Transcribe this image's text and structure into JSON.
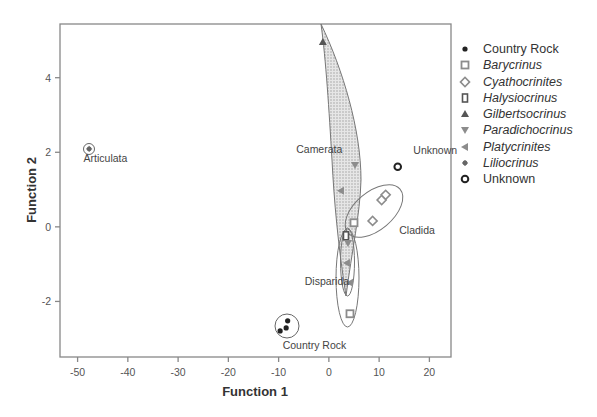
{
  "chart_data": {
    "type": "scatter",
    "title": "",
    "xlabel": "Function 1",
    "ylabel": "Function 2",
    "xlim": [
      -53.5,
      24.3
    ],
    "ylim": [
      -3.49,
      5.44
    ],
    "xticks": [
      -50,
      -40,
      -30,
      -20,
      -10,
      0,
      10,
      20
    ],
    "yticks": [
      -2,
      0,
      2,
      4
    ],
    "grid": false,
    "legend_position": "right",
    "series": [
      {
        "name": "Country Rock",
        "italic": false,
        "marker": "dot",
        "points": [
          [
            -8.2,
            -2.52
          ],
          [
            -8.5,
            -2.71
          ],
          [
            -9.7,
            -2.79
          ]
        ]
      },
      {
        "name": "Barycrinus",
        "italic": true,
        "marker": "square-open",
        "points": [
          [
            5.0,
            0.11
          ],
          [
            4.2,
            -2.33
          ]
        ]
      },
      {
        "name": "Cyathocrinites",
        "italic": true,
        "marker": "diamond-open",
        "points": [
          [
            10.5,
            0.72
          ],
          [
            11.3,
            0.86
          ],
          [
            8.7,
            0.16
          ]
        ]
      },
      {
        "name": "Halysiocrinus",
        "italic": true,
        "marker": "square-bar",
        "points": [
          [
            3.4,
            -0.24
          ]
        ]
      },
      {
        "name": "Gilbertsocrinus",
        "italic": true,
        "marker": "triangle-up",
        "points": [
          [
            -1.2,
            4.96
          ]
        ]
      },
      {
        "name": "Paradichocrinus",
        "italic": true,
        "marker": "triangle-down",
        "points": [
          [
            5.2,
            1.66
          ],
          [
            3.8,
            -0.43
          ]
        ]
      },
      {
        "name": "Platycrinites",
        "italic": true,
        "marker": "triangle-left",
        "points": [
          [
            2.4,
            0.97
          ],
          [
            3.6,
            -0.97
          ],
          [
            4.2,
            -1.5
          ]
        ]
      },
      {
        "name": "Liliocrinus",
        "italic": true,
        "marker": "plus-dot",
        "points": [
          [
            -47.7,
            2.09
          ]
        ]
      },
      {
        "name": "Unknown",
        "italic": false,
        "marker": "circle-open",
        "points": [
          [
            13.7,
            1.61
          ]
        ]
      }
    ],
    "annotations": [
      {
        "text": "Articulata",
        "x": -48.8,
        "y": 1.73
      },
      {
        "text": "Camerata",
        "x": -6.5,
        "y": 1.98
      },
      {
        "text": "Unknown",
        "x": 16.8,
        "y": 1.95
      },
      {
        "text": "Cladida",
        "x": 14.0,
        "y": -0.18
      },
      {
        "text": "Disparida",
        "x": -4.8,
        "y": -1.55
      },
      {
        "text": "Country Rock",
        "x": -9.2,
        "y": -3.27
      }
    ],
    "group_outlines": [
      {
        "name": "Camerata",
        "shape": "shaded-polygon"
      },
      {
        "name": "Cladida",
        "shape": "ellipse"
      },
      {
        "name": "Disparida",
        "shape": "ellipse"
      },
      {
        "name": "Country Rock",
        "shape": "circle"
      },
      {
        "name": "Articulata",
        "shape": "circle"
      },
      {
        "name": "Unknown",
        "shape": "none"
      }
    ]
  },
  "colors": {
    "axis": "#888888",
    "marker_dark": "#222222",
    "marker_gray": "#8c8c8c",
    "shading": "#d0d0d0"
  }
}
